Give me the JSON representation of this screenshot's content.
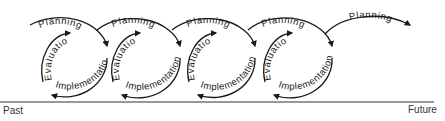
{
  "diagram": {
    "type": "cyclical-process-spiral",
    "stroke_color": "#1a1a1a",
    "cycle_count": 4,
    "cycles": [
      {
        "planning": "Planning",
        "implementation": "Implementation",
        "evaluation": "Evaluation"
      },
      {
        "planning": "Planning",
        "implementation": "Implementation",
        "evaluation": "Evaluation"
      },
      {
        "planning": "Planning",
        "implementation": "Implementation",
        "evaluation": "Evaluation"
      },
      {
        "planning": "Planning",
        "implementation": "Implementation",
        "evaluation": "Evaluation"
      }
    ],
    "final_stage": {
      "planning": "Planning"
    },
    "timeline": {
      "start_label": "Past",
      "end_label": "Future"
    }
  }
}
